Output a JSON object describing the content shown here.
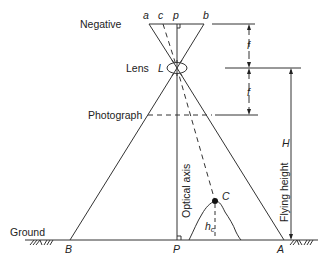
{
  "diagram": {
    "type": "aerial photograph geometry (vertical photo)",
    "labels": {
      "negative": "Negative",
      "lens": "Lens",
      "photograph": "Photograph",
      "ground": "Ground",
      "optical_axis": "Optical axis",
      "flying_height": "Flying height"
    },
    "points": {
      "a": "a",
      "c": "c",
      "p": "p",
      "b": "b",
      "L": "L",
      "B": "B",
      "P": "P",
      "A": "A",
      "C": "C",
      "hc_main": "h",
      "hc_sub": "c"
    },
    "dimensions": {
      "f_upper": "f",
      "f_lower": "f",
      "H": "H"
    },
    "colors": {
      "line": "#333333",
      "text": "#222222",
      "background": "#ffffff"
    }
  }
}
